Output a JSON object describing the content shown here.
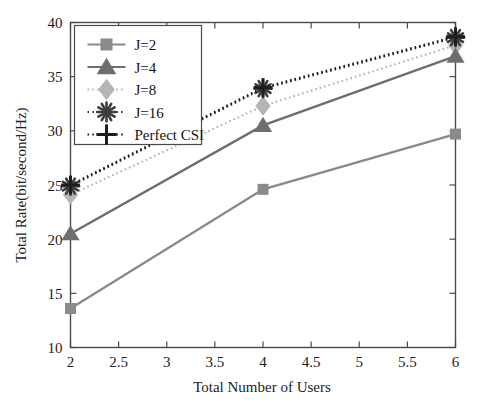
{
  "chart_data": {
    "type": "line",
    "title": "",
    "xlabel": "Total Number of Users",
    "ylabel": "Total Rate(bit/second/Hz)",
    "x": [
      2,
      4,
      6
    ],
    "xlim": [
      2,
      6
    ],
    "ylim": [
      10,
      40
    ],
    "xticks": [
      2,
      2.5,
      3,
      3.5,
      4,
      4.5,
      5,
      5.5,
      6
    ],
    "xtick_labels": [
      "2",
      "2.5",
      "3",
      "3.5",
      "4",
      "4.5",
      "5",
      "5.5",
      "6"
    ],
    "yticks": [
      10,
      15,
      20,
      25,
      30,
      35,
      40
    ],
    "ytick_labels": [
      "10",
      "15",
      "20",
      "25",
      "30",
      "35",
      "40"
    ],
    "grid": false,
    "legend_position": "upper left",
    "series": [
      {
        "name": "J=2",
        "values": [
          13.6,
          24.6,
          29.7
        ],
        "marker": "square",
        "linestyle": "solid",
        "color": "#8a8a8a"
      },
      {
        "name": "J=4",
        "values": [
          20.5,
          30.5,
          36.9
        ],
        "marker": "triangle",
        "linestyle": "solid",
        "color": "#6e6e6e"
      },
      {
        "name": "J=8",
        "values": [
          24.1,
          32.3,
          37.9
        ],
        "marker": "diamond",
        "linestyle": "dotted",
        "color": "#b5b5b5"
      },
      {
        "name": "J=16",
        "values": [
          24.9,
          33.9,
          38.6
        ],
        "marker": "star",
        "linestyle": "dotted",
        "color": "#3c3c3c"
      },
      {
        "name": "Perfect CSI",
        "values": [
          25.0,
          34.0,
          38.7
        ],
        "marker": "plus",
        "linestyle": "dotted",
        "color": "#1e1e1e"
      }
    ]
  },
  "legend": {
    "entries": [
      {
        "label": "J=2"
      },
      {
        "label": "J=4"
      },
      {
        "label": "J=8"
      },
      {
        "label": "J=16"
      },
      {
        "label": "Perfect CSI"
      }
    ]
  },
  "axes": {
    "x_title": "Total Number of Users",
    "y_title": "Total Rate(bit/second/Hz)"
  }
}
